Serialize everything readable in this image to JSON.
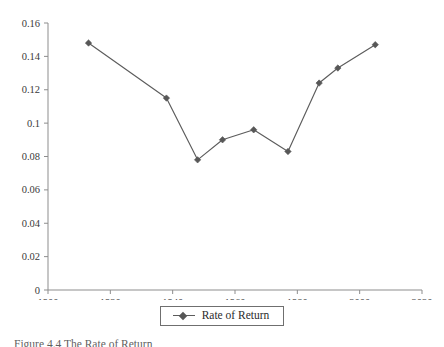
{
  "chart_data": {
    "type": "line",
    "title": "",
    "xlabel": "",
    "ylabel": "",
    "xlim": [
      1900,
      2020
    ],
    "ylim": [
      0,
      0.16
    ],
    "xticks": [
      "1900",
      "1920",
      "1940",
      "1960",
      "1980",
      "2000",
      "2020"
    ],
    "xtick_values": [
      1900,
      1920,
      1940,
      1960,
      1980,
      2000,
      2020
    ],
    "yticks": [
      "0",
      "0.02",
      "0.04",
      "0.06",
      "0.08",
      "0.1",
      "0.12",
      "0.14",
      "0.16"
    ],
    "ytick_values": [
      0,
      0.02,
      0.04,
      0.06,
      0.08,
      0.1,
      0.12,
      0.14,
      0.16
    ],
    "grid": false,
    "legend_position": "bottom-center",
    "series": [
      {
        "name": "Rate of Return",
        "color": "#575757",
        "marker": "diamond",
        "x": [
          1913,
          1938,
          1948,
          1956,
          1966,
          1977,
          1987,
          1993,
          2005
        ],
        "values": [
          0.148,
          0.115,
          0.078,
          0.09,
          0.096,
          0.083,
          0.124,
          0.133,
          0.147
        ]
      }
    ]
  },
  "legend": {
    "entries": [
      {
        "label": "Rate of Return"
      }
    ]
  },
  "caption": {
    "text": "Figure 4.4  The Rate of Return"
  }
}
